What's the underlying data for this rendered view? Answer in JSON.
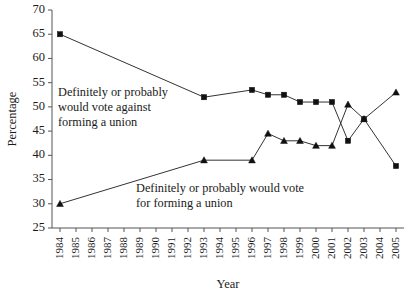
{
  "chart_data": {
    "type": "line",
    "title": "",
    "xlabel": "Year",
    "ylabel": "Percentage",
    "ylim": [
      25,
      70
    ],
    "ytick_step": 5,
    "grid": false,
    "legend_position": "inline-annotation",
    "yticks": [
      "70",
      "65",
      "60",
      "55",
      "50",
      "45",
      "40",
      "35",
      "30",
      "25"
    ],
    "categories": [
      "1984",
      "1985",
      "1986",
      "1987",
      "1988",
      "1989",
      "1990",
      "1991",
      "1992",
      "1993",
      "1994",
      "1995",
      "1996",
      "1997",
      "1998",
      "1999",
      "2000",
      "2001",
      "2002",
      "2003",
      "2004",
      "2005"
    ],
    "series": [
      {
        "name": "Definitely or probably would vote against forming a union",
        "marker": "square",
        "x": [
          "1984",
          "1993",
          "1996",
          "1997",
          "1998",
          "1999",
          "2000",
          "2001",
          "2002",
          "2003",
          "2005"
        ],
        "values": [
          65,
          52,
          53.5,
          52.5,
          52.5,
          51,
          51,
          51,
          43,
          47.5,
          37.8
        ]
      },
      {
        "name": "Definitely or probably would vote for forming a union",
        "marker": "triangle",
        "x": [
          "1984",
          "1993",
          "1996",
          "1997",
          "1998",
          "1999",
          "2000",
          "2001",
          "2002",
          "2003",
          "2005"
        ],
        "values": [
          30,
          39,
          39,
          44.5,
          43,
          43,
          42,
          42,
          50.5,
          47.5,
          53
        ]
      }
    ],
    "annotations": [
      {
        "id": "annotation-against",
        "lines": [
          "Definitely or probably",
          "would vote against",
          "forming a union"
        ]
      },
      {
        "id": "annotation-for",
        "lines": [
          "Definitely or probably would vote",
          "for forming a union"
        ]
      }
    ]
  }
}
